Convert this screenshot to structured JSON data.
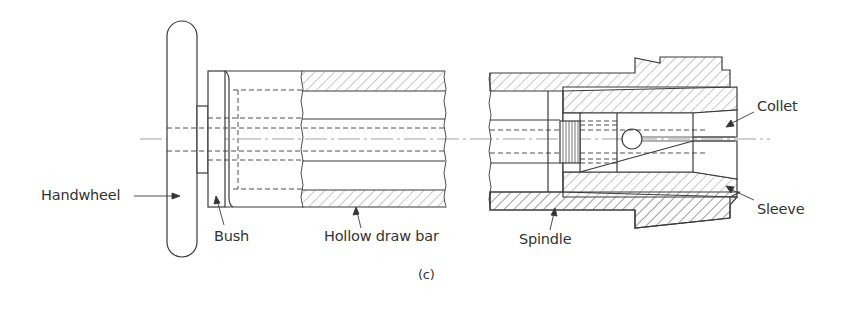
{
  "figure": {
    "caption": "(c)",
    "labels": {
      "handwheel": "Handwheel",
      "bush": "Bush",
      "hollow_draw_bar": "Hollow draw bar",
      "spindle": "Spindle",
      "collet": "Collet",
      "sleeve": "Sleeve"
    },
    "colors": {
      "line": "#3a3a3a",
      "hatch": "#6a6a6a",
      "background": "#ffffff"
    }
  }
}
